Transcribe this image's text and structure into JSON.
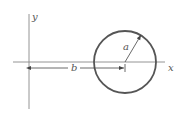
{
  "diagram": {
    "labels": {
      "y_axis": "y",
      "x_axis": "x",
      "radius": "a",
      "offset": "b"
    },
    "geometry": {
      "circle_center": [
        125,
        62
      ],
      "circle_radius": 31,
      "x_axis_y": 62,
      "y_axis_x": 29
    },
    "colors": {
      "axis": "#888888",
      "circle": "#555555",
      "text": "#555555"
    }
  }
}
